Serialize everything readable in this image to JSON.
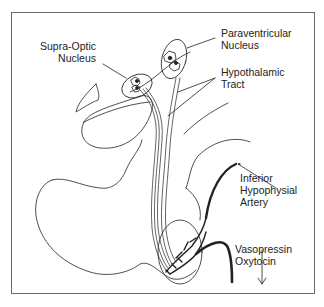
{
  "diagram": {
    "type": "anatomical-illustration",
    "line_color": "#222222",
    "frame_color": "#6a6a6a",
    "labels": {
      "supra_optic": {
        "line1": "Supra-Optic",
        "line2": "Nucleus"
      },
      "paraventricular": {
        "line1": "Paraventricular",
        "line2": "Nucleus"
      },
      "hypothalamic_tract": {
        "line1": "Hypothalamic",
        "line2": "Tract"
      },
      "inferior_artery": {
        "line1": "Inferior",
        "line2": "Hypophysial",
        "line3": "Artery"
      },
      "hormones": {
        "line1": "Vasopressin",
        "line2": "Oxytocin"
      }
    }
  }
}
